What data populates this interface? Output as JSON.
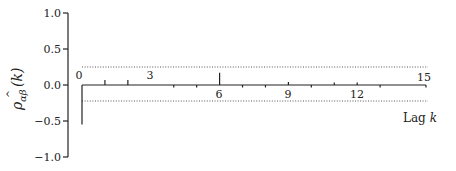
{
  "chart_data": {
    "type": "bar",
    "subtype": "autocorrelation-stem",
    "title": "",
    "xlabel": "Lag k",
    "ylabel": "ρ̂αβ(k)",
    "ylabel_parts": {
      "symbol": "ρ",
      "hat": true,
      "subscript": "αβ",
      "arg": "(k)"
    },
    "ylim": [
      -1.0,
      1.0
    ],
    "yticks": [
      1.0,
      0.5,
      0.0,
      -0.5,
      -1.0
    ],
    "ytick_labels": [
      "1.0",
      "0.5",
      "0.0",
      "−0.5",
      "−1.0"
    ],
    "xlim": [
      0,
      15
    ],
    "x_tick_labels_shown": [
      0,
      3,
      6,
      9,
      12,
      15
    ],
    "categories": [
      0,
      1,
      2,
      3,
      4,
      5,
      6,
      7,
      8,
      9,
      10,
      11,
      12,
      13,
      14,
      15
    ],
    "values": [
      -0.55,
      0.07,
      0.07,
      0.0,
      -0.03,
      -0.03,
      0.17,
      -0.03,
      -0.03,
      0.04,
      -0.03,
      0.03,
      0.03,
      -0.03,
      0.0,
      -0.03
    ],
    "confidence_band": {
      "upper": 0.25,
      "lower": -0.22,
      "style": "dotted"
    },
    "grid": false,
    "legend": null
  },
  "labels": {
    "ytick_1": "1.0",
    "ytick_05": "0.5",
    "ytick_0": "0.0",
    "ytick_m05": "−0.5",
    "ytick_m1": "−1.0",
    "lag_0": "0",
    "lag_3": "3",
    "lag_6": "6",
    "lag_9": "9",
    "lag_12": "12",
    "lag_15": "15",
    "xlabel_text": "Lag ",
    "xlabel_var": "k",
    "ylabel_symbol": "ρ",
    "ylabel_hat": "^",
    "ylabel_sub": "αβ",
    "ylabel_arg": "(k)"
  }
}
